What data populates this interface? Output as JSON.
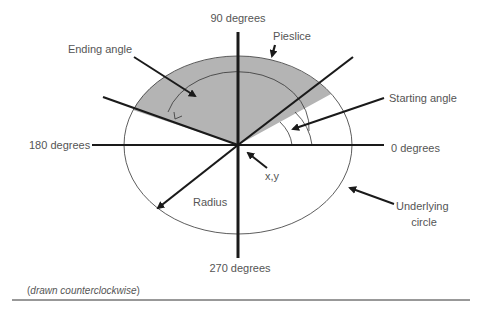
{
  "diagram": {
    "labels": {
      "deg90": "90 degrees",
      "deg180": "180 degrees",
      "deg0": "0 degrees",
      "deg270": "270 degrees",
      "ending_angle": "Ending angle",
      "starting_angle": "Starting angle",
      "pieslice": "Pieslice",
      "xy": "x,y",
      "radius": "Radius",
      "underlying_circle_line1": "Underlying",
      "underlying_circle_line2": "circle"
    },
    "caption": {
      "open": "(",
      "italic": "drawn counterclockwise",
      "close": ")"
    },
    "colors": {
      "slice_fill": "#b4b4b4",
      "lines": "#1a1a1a",
      "text": "#555555",
      "rule": "#333333"
    },
    "geometry": {
      "center": [
        238,
        145
      ],
      "start_angle_deg": 35,
      "end_angle_deg": 157
    }
  }
}
